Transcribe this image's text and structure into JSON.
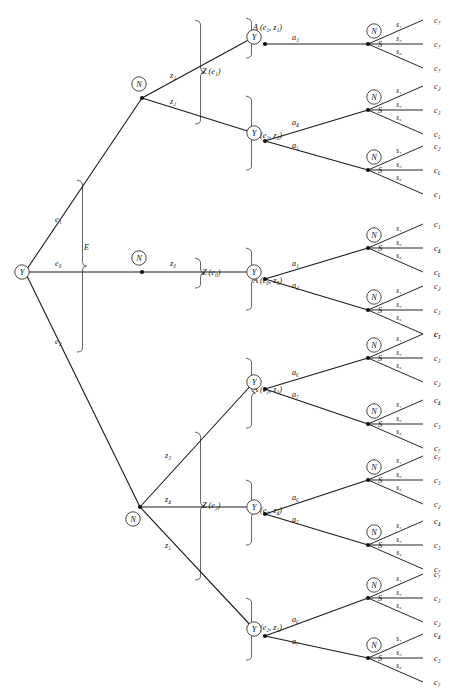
{
  "figure": {
    "type": "decision-tree",
    "stage_nodes": {
      "decision_maker": "Y",
      "nature": "N",
      "state_fan_label": "S"
    },
    "root": {
      "label": "Y",
      "x": 22,
      "y": 272
    }
  },
  "braces": {
    "experiment": {
      "label": "E",
      "x": 78,
      "y_top": 180,
      "y_bottom": 352,
      "label_x": 84,
      "label_y": 250
    },
    "outcome_e1": {
      "label": "Z (e₁)",
      "x": 196,
      "y_top": 20,
      "y_bottom": 124,
      "label_x": 202,
      "label_y": 74
    },
    "outcome_e0": {
      "label": "Z (e₀)",
      "x": 196,
      "y_top": 258,
      "y_bottom": 288,
      "label_x": 202,
      "label_y": 275
    },
    "outcome_e2": {
      "label": "Z (e₂)",
      "x": 196,
      "y_top": 432,
      "y_bottom": 580,
      "label_x": 202,
      "label_y": 508
    },
    "actions": [
      {
        "label": "A (e₁, z₁)",
        "x": 247,
        "y_top": 18,
        "y_bottom": 58,
        "label_x": 253,
        "label_y": 30
      },
      {
        "label": "A (e₁, z₂)",
        "x": 247,
        "y_top": 96,
        "y_bottom": 170,
        "label_x": 253,
        "label_y": 138
      },
      {
        "label": "A (e₀, z₀)",
        "x": 247,
        "y_top": 248,
        "y_bottom": 310,
        "label_x": 253,
        "label_y": 283
      },
      {
        "label": "A (e₂, z₃)",
        "x": 247,
        "y_top": 358,
        "y_bottom": 428,
        "label_x": 253,
        "label_y": 392
      },
      {
        "label": "A (e₂, z₄)",
        "x": 247,
        "y_top": 480,
        "y_bottom": 545,
        "label_x": 253,
        "label_y": 513
      },
      {
        "label": "A (e₂, z₅)",
        "x": 247,
        "y_top": 598,
        "y_bottom": 660,
        "label_x": 253,
        "label_y": 630
      }
    ]
  },
  "experiment_edges": [
    {
      "label": "e₁",
      "label_x": 55,
      "label_y": 222,
      "from": [
        25,
        272
      ],
      "to": [
        142,
        98
      ]
    },
    {
      "label": "e₀",
      "label_x": 55,
      "label_y": 266,
      "from": [
        25,
        272
      ],
      "to": [
        142,
        272
      ]
    },
    {
      "label": "e₂",
      "label_x": 55,
      "label_y": 344,
      "from": [
        25,
        272
      ],
      "to": [
        140,
        507
      ]
    }
  ],
  "nature_nodes": [
    {
      "name": "N-e1",
      "cx": 139,
      "cy": 84,
      "jx": 142,
      "jy": 98
    },
    {
      "name": "N-e0",
      "cx": 139,
      "cy": 258,
      "jx": 142,
      "jy": 272
    },
    {
      "name": "N-e2",
      "cx": 133,
      "cy": 519,
      "jx": 140,
      "jy": 507
    }
  ],
  "outcome_edges": [
    {
      "label": "z₁",
      "label_x": 170,
      "label_y": 78,
      "from": [
        142,
        98
      ],
      "to": [
        254,
        37
      ]
    },
    {
      "label": "z₂",
      "label_x": 170,
      "label_y": 104,
      "from": [
        142,
        98
      ],
      "to": [
        254,
        133
      ]
    },
    {
      "label": "z₀",
      "label_x": 170,
      "label_y": 266,
      "from": [
        142,
        272
      ],
      "to": [
        254,
        272
      ]
    },
    {
      "label": "z₃",
      "label_x": 165,
      "label_y": 458,
      "from": [
        140,
        507
      ],
      "to": [
        254,
        382
      ]
    },
    {
      "label": "z₄",
      "label_x": 165,
      "label_y": 502,
      "from": [
        140,
        507
      ],
      "to": [
        254,
        507
      ]
    },
    {
      "label": "z₅",
      "label_x": 165,
      "label_y": 548,
      "from": [
        140,
        507
      ],
      "to": [
        254,
        629
      ]
    }
  ],
  "decision_nodes": [
    {
      "name": "Y-z1",
      "cx": 254,
      "cy": 37,
      "jx": 265,
      "jy": 44
    },
    {
      "name": "Y-z2",
      "cx": 254,
      "cy": 133,
      "jx": 265,
      "jy": 141
    },
    {
      "name": "Y-z0",
      "cx": 254,
      "cy": 272,
      "jx": 265,
      "jy": 279
    },
    {
      "name": "Y-z3",
      "cx": 254,
      "cy": 382,
      "jx": 265,
      "jy": 389
    },
    {
      "name": "Y-z4",
      "cx": 254,
      "cy": 507,
      "jx": 265,
      "jy": 514
    },
    {
      "name": "Y-z5",
      "cx": 254,
      "cy": 629,
      "jx": 265,
      "jy": 636
    }
  ],
  "action_groups": [
    {
      "name": "A-e1-z1",
      "parent": [
        265,
        44
      ],
      "branches": [
        {
          "label": "a₃",
          "label_x": 292,
          "label_y": 40,
          "to": [
            368,
            44
          ]
        }
      ]
    },
    {
      "name": "A-e1-z2",
      "parent": [
        265,
        141
      ],
      "branches": [
        {
          "label": "a₄",
          "label_x": 292,
          "label_y": 125,
          "to": [
            368,
            110
          ]
        },
        {
          "label": "a₅",
          "label_x": 292,
          "label_y": 148,
          "to": [
            368,
            170
          ]
        }
      ]
    },
    {
      "name": "A-e0-z0",
      "parent": [
        265,
        279
      ],
      "branches": [
        {
          "label": "a₁",
          "label_x": 292,
          "label_y": 266,
          "to": [
            368,
            248
          ]
        },
        {
          "label": "a₂",
          "label_x": 292,
          "label_y": 288,
          "to": [
            368,
            310
          ]
        }
      ]
    },
    {
      "name": "A-e2-z3",
      "parent": [
        265,
        389
      ],
      "branches": [
        {
          "label": "a₆",
          "label_x": 292,
          "label_y": 375,
          "to": [
            368,
            358
          ]
        },
        {
          "label": "a₇",
          "label_x": 292,
          "label_y": 397,
          "to": [
            368,
            424
          ]
        }
      ]
    },
    {
      "name": "A-e2-z4",
      "parent": [
        265,
        514
      ],
      "branches": [
        {
          "label": "a₆",
          "label_x": 292,
          "label_y": 500,
          "to": [
            368,
            480
          ]
        },
        {
          "label": "a₇",
          "label_x": 292,
          "label_y": 522,
          "to": [
            368,
            545
          ]
        }
      ]
    },
    {
      "name": "A-e2-z5",
      "parent": [
        265,
        636
      ],
      "branches": [
        {
          "label": "a₆",
          "label_x": 292,
          "label_y": 622,
          "to": [
            368,
            598
          ]
        },
        {
          "label": "a₇",
          "label_x": 292,
          "label_y": 644,
          "to": [
            368,
            658
          ]
        }
      ]
    }
  ],
  "state_labels": [
    "s₁",
    "s₂",
    "s₃"
  ],
  "state_fan_label": "S",
  "state_fans": [
    {
      "name": "fan-a3",
      "jx": 368,
      "jy": 44,
      "n_cx": 374,
      "n_cy": 31,
      "leaves": [
        "c₇",
        "c₇",
        "c₇"
      ]
    },
    {
      "name": "fan-a4",
      "jx": 368,
      "jy": 110,
      "n_cx": 374,
      "n_cy": 97,
      "leaves": [
        "c₂",
        "c₃",
        "c₅"
      ]
    },
    {
      "name": "fan-a5",
      "jx": 368,
      "jy": 170,
      "n_cx": 374,
      "n_cy": 157,
      "leaves": [
        "c₂",
        "c₆",
        "c₁"
      ]
    },
    {
      "name": "fan-a1",
      "jx": 368,
      "jy": 248,
      "n_cx": 374,
      "n_cy": 235,
      "leaves": [
        "c₁",
        "c₄",
        "c₆"
      ]
    },
    {
      "name": "fan-a2",
      "jx": 368,
      "jy": 310,
      "n_cx": 374,
      "n_cy": 297,
      "leaves": [
        "c₂",
        "c₃",
        "c₁"
      ]
    },
    {
      "name": "fan-a6a",
      "jx": 368,
      "jy": 358,
      "n_cx": 374,
      "n_cy": 345,
      "leaves": [
        "c₇",
        "c₃",
        "c₂"
      ]
    },
    {
      "name": "fan-a7a",
      "jx": 368,
      "jy": 424,
      "n_cx": 374,
      "n_cy": 411,
      "leaves": [
        "c₄",
        "c₃",
        "c₇"
      ]
    },
    {
      "name": "fan-a6b",
      "jx": 368,
      "jy": 480,
      "n_cx": 374,
      "n_cy": 467,
      "leaves": [
        "c₇",
        "c₃",
        "c₂"
      ]
    },
    {
      "name": "fan-a7b",
      "jx": 368,
      "jy": 545,
      "n_cx": 374,
      "n_cy": 532,
      "leaves": [
        "c₄",
        "c₃",
        "c₇"
      ]
    },
    {
      "name": "fan-a6c",
      "jx": 368,
      "jy": 598,
      "n_cx": 374,
      "n_cy": 585,
      "leaves": [
        "c₇",
        "c₃",
        "c₂"
      ]
    },
    {
      "name": "fan-a7c",
      "jx": 368,
      "jy": 658,
      "n_cx": 374,
      "n_cy": 645,
      "leaves": [
        "c₄",
        "c₃",
        "c₇"
      ]
    }
  ],
  "fan_geometry": {
    "dx": 55,
    "dy_top": -24,
    "dy_mid": 0,
    "dy_bot": 24,
    "leaf_x": 434
  }
}
